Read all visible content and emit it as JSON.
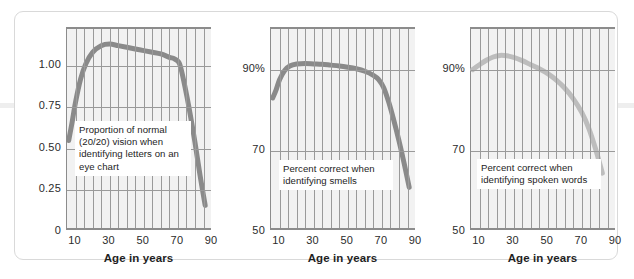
{
  "figure": {
    "panel_count": 3,
    "background": "#ffffff",
    "frame_color": "#d9d9d9",
    "grid_color": "#9a9a9a",
    "plot_bg": "#f2f2f2"
  },
  "chart_data": [
    {
      "type": "line",
      "title": "",
      "caption": "Proportion of normal (20/20) vision when identifying letters on an eye chart",
      "xlabel": "Age in years",
      "ylabel": "",
      "xlim": [
        5,
        90
      ],
      "ylim": [
        0,
        1.22
      ],
      "xticks": [
        10,
        30,
        50,
        70,
        90
      ],
      "xtick_labels": [
        "10",
        "30",
        "50",
        "70",
        "90"
      ],
      "yticks": [
        0,
        0.25,
        0.5,
        0.75,
        1.0
      ],
      "ytick_labels": [
        "0",
        "0.25",
        "0.50",
        "0.75",
        "1.00"
      ],
      "grid": true,
      "legend": "none",
      "line_color": "#8a8a8a",
      "line_width": 5,
      "x": [
        6,
        8,
        10,
        13,
        16,
        20,
        25,
        30,
        35,
        40,
        45,
        50,
        55,
        60,
        65,
        68,
        71,
        74,
        77,
        80,
        83,
        86
      ],
      "values": [
        0.55,
        0.66,
        0.78,
        0.92,
        1.01,
        1.08,
        1.12,
        1.13,
        1.12,
        1.11,
        1.1,
        1.09,
        1.08,
        1.07,
        1.05,
        1.04,
        1.01,
        0.88,
        0.72,
        0.54,
        0.34,
        0.16
      ]
    },
    {
      "type": "line",
      "title": "",
      "caption": "Percent correct when identifying smells",
      "xlabel": "Age in years",
      "ylabel": "",
      "xlim": [
        5,
        90
      ],
      "ylim": [
        50,
        100
      ],
      "xticks": [
        10,
        30,
        50,
        70,
        90
      ],
      "xtick_labels": [
        "10",
        "30",
        "50",
        "70",
        "90"
      ],
      "yticks": [
        50,
        70,
        90
      ],
      "ytick_labels": [
        "50",
        "70",
        "90%"
      ],
      "grid": true,
      "legend": "none",
      "line_color": "#8a8a8a",
      "line_width": 5,
      "x": [
        6,
        8,
        10,
        13,
        16,
        20,
        25,
        30,
        35,
        40,
        45,
        50,
        55,
        60,
        65,
        68,
        71,
        74,
        77,
        80,
        83,
        86
      ],
      "values": [
        83.0,
        85.0,
        87.5,
        89.8,
        90.9,
        91.4,
        91.5,
        91.4,
        91.3,
        91.1,
        90.9,
        90.6,
        90.2,
        89.6,
        88.6,
        87.6,
        85.6,
        82.0,
        77.5,
        72.5,
        67.0,
        61.0
      ]
    },
    {
      "type": "line",
      "title": "",
      "caption": "Percent correct when identifying spoken words",
      "xlabel": "Age in years",
      "ylabel": "",
      "xlim": [
        5,
        90
      ],
      "ylim": [
        50,
        100
      ],
      "xticks": [
        10,
        30,
        50,
        70,
        90
      ],
      "xtick_labels": [
        "10",
        "30",
        "50",
        "70",
        "90"
      ],
      "yticks": [
        50,
        70,
        90
      ],
      "ytick_labels": [
        "50",
        "70",
        "90%"
      ],
      "grid": true,
      "legend": "none",
      "line_color": "#bdbdbd",
      "line_width": 5,
      "x": [
        6,
        10,
        14,
        18,
        22,
        26,
        30,
        35,
        40,
        45,
        50,
        55,
        60,
        65,
        70,
        74,
        78,
        82
      ],
      "values": [
        90.0,
        91.2,
        92.3,
        93.1,
        93.5,
        93.4,
        93.0,
        92.2,
        91.2,
        90.2,
        89.0,
        87.4,
        85.4,
        82.8,
        79.4,
        75.6,
        70.5,
        64.5
      ]
    }
  ]
}
